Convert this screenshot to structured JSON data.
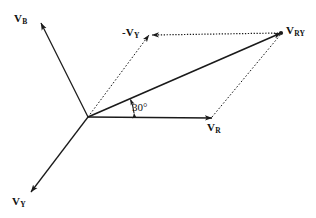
{
  "diagram": {
    "type": "phasor-vector-diagram",
    "background_color": "#ffffff",
    "stroke_color": "#1a1a1a",
    "origin": {
      "x": 88,
      "y": 117
    },
    "vectors": [
      {
        "id": "vb",
        "label_base": "V",
        "label_sub": "B",
        "label_x": 14,
        "label_y": 13,
        "style": "solid",
        "from": {
          "x": 88,
          "y": 117
        },
        "to": {
          "x": 41,
          "y": 23
        },
        "arrow": true
      },
      {
        "id": "vy",
        "label_base": "V",
        "label_sub": "Y",
        "label_x": 12,
        "label_y": 196,
        "style": "solid",
        "from": {
          "x": 88,
          "y": 117
        },
        "to": {
          "x": 31,
          "y": 192
        },
        "arrow": true
      },
      {
        "id": "vr",
        "label_base": "V",
        "label_sub": "R",
        "label_x": 207,
        "label_y": 122,
        "style": "solid",
        "from": {
          "x": 88,
          "y": 117
        },
        "to": {
          "x": 212,
          "y": 118
        },
        "arrow": true
      },
      {
        "id": "vry",
        "label_base": "V",
        "label_sub": "RY",
        "label_x": 286,
        "label_y": 25,
        "style": "solid",
        "from": {
          "x": 88,
          "y": 117
        },
        "to": {
          "x": 281,
          "y": 33
        },
        "arrow": true
      },
      {
        "id": "minus-vy",
        "label_base": "-V",
        "label_sub": "Y",
        "label_x": 122,
        "label_y": 27,
        "style": "dotted",
        "from": {
          "x": 88,
          "y": 117
        },
        "to": {
          "x": 149,
          "y": 35
        },
        "arrow": true
      }
    ],
    "construction_lines": [
      {
        "id": "top-parallel",
        "style": "dotted",
        "from": {
          "x": 281,
          "y": 33
        },
        "to": {
          "x": 150,
          "y": 35
        },
        "arrow": true
      },
      {
        "id": "right-parallel",
        "style": "dotted",
        "from": {
          "x": 213,
          "y": 117
        },
        "to": {
          "x": 281,
          "y": 33
        },
        "arrow": false
      }
    ],
    "angle": {
      "value": "30°",
      "label_x": 132,
      "label_y": 102,
      "between": [
        "vr",
        "vry"
      ],
      "vertex": {
        "x": 88,
        "y": 117
      }
    }
  }
}
